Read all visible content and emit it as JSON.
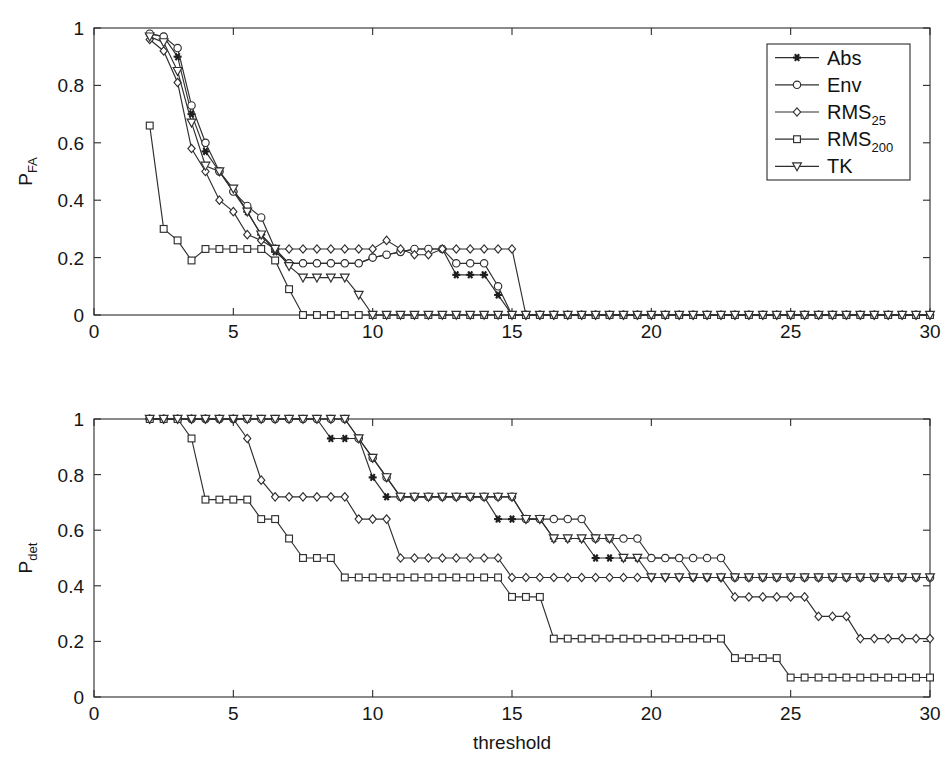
{
  "figure": {
    "background": "#ffffff",
    "ink": "#2b2b2b",
    "xlabel": "threshold"
  },
  "legend": {
    "position": "top-right of upper axes",
    "entries": [
      {
        "label": "Abs",
        "label_sub": "",
        "marker": "star-filled"
      },
      {
        "label": "Env",
        "label_sub": "",
        "marker": "circle-open"
      },
      {
        "label": "RMS",
        "label_sub": "25",
        "marker": "diamond-open"
      },
      {
        "label": "RMS",
        "label_sub": "200",
        "marker": "square-open"
      },
      {
        "label": "TK",
        "label_sub": "",
        "marker": "triangle-down-open"
      }
    ]
  },
  "chart_data": [
    {
      "type": "line",
      "title": "",
      "xlabel": "",
      "ylabel": "P",
      "ylabel_sub": "FA",
      "xlim": [
        0,
        30
      ],
      "ylim": [
        0,
        1
      ],
      "xticks": [
        0,
        5,
        10,
        15,
        20,
        25,
        30
      ],
      "yticks": [
        0,
        0.2,
        0.4,
        0.6,
        0.8,
        1
      ],
      "xticklabels": [
        "0",
        "5",
        "10",
        "15",
        "20",
        "25",
        "30"
      ],
      "yticklabels": [
        "0",
        "0.2",
        "0.4",
        "0.6",
        "0.8",
        "1"
      ],
      "grid": false,
      "legend_position": "upper right",
      "x": [
        2,
        2.5,
        3,
        3.5,
        4,
        4.5,
        5,
        5.5,
        6,
        6.5,
        7,
        7.5,
        8,
        8.5,
        9,
        9.5,
        10,
        10.5,
        11,
        11.5,
        12,
        12.5,
        13,
        13.5,
        14,
        14.5,
        15,
        15.5,
        16,
        16.5,
        17,
        17.5,
        18,
        18.5,
        19,
        19.5,
        20,
        20.5,
        21,
        21.5,
        22,
        22.5,
        23,
        23.5,
        24,
        24.5,
        25,
        25.5,
        26,
        26.5,
        27,
        27.5,
        28,
        28.5,
        29,
        29.5,
        30
      ],
      "series": [
        {
          "name": "Abs",
          "marker": "star-filled",
          "values": [
            0.98,
            0.97,
            0.9,
            0.7,
            0.57,
            0.5,
            0.43,
            0.36,
            0.28,
            0.22,
            0.18,
            0.18,
            0.18,
            0.18,
            0.18,
            0.18,
            0.2,
            0.21,
            0.22,
            0.23,
            0.23,
            0.23,
            0.14,
            0.14,
            0.14,
            0.07,
            0.0,
            0.0,
            0,
            0,
            0,
            0,
            0,
            0,
            0,
            0,
            0,
            0,
            0,
            0,
            0,
            0,
            0,
            0,
            0,
            0,
            0,
            0,
            0,
            0,
            0,
            0,
            0,
            0,
            0,
            0,
            0
          ]
        },
        {
          "name": "Env",
          "marker": "circle-open",
          "values": [
            0.98,
            0.97,
            0.93,
            0.73,
            0.6,
            0.5,
            0.43,
            0.38,
            0.34,
            0.23,
            0.18,
            0.18,
            0.18,
            0.18,
            0.18,
            0.18,
            0.2,
            0.21,
            0.22,
            0.23,
            0.23,
            0.23,
            0.18,
            0.18,
            0.18,
            0.1,
            0.0,
            0.0,
            0,
            0,
            0,
            0,
            0,
            0,
            0,
            0,
            0,
            0,
            0,
            0,
            0,
            0,
            0,
            0,
            0,
            0,
            0,
            0,
            0,
            0,
            0,
            0,
            0,
            0,
            0,
            0,
            0
          ]
        },
        {
          "name": "RMS25",
          "marker": "diamond-open",
          "values": [
            0.96,
            0.92,
            0.81,
            0.58,
            0.5,
            0.4,
            0.36,
            0.28,
            0.26,
            0.23,
            0.23,
            0.23,
            0.23,
            0.23,
            0.23,
            0.23,
            0.23,
            0.26,
            0.23,
            0.21,
            0.21,
            0.23,
            0.23,
            0.23,
            0.23,
            0.23,
            0.23,
            0.0,
            0,
            0,
            0,
            0,
            0,
            0,
            0,
            0,
            0,
            0,
            0,
            0,
            0,
            0,
            0,
            0,
            0,
            0,
            0,
            0,
            0,
            0,
            0,
            0,
            0,
            0,
            0,
            0,
            0
          ]
        },
        {
          "name": "RMS200",
          "marker": "square-open",
          "values": [
            0.66,
            0.3,
            0.26,
            0.19,
            0.23,
            0.23,
            0.23,
            0.23,
            0.23,
            0.19,
            0.09,
            0.0,
            0.0,
            0,
            0,
            0,
            0,
            0,
            0,
            0,
            0,
            0,
            0,
            0,
            0,
            0,
            0,
            0,
            0,
            0,
            0,
            0,
            0,
            0,
            0,
            0,
            0,
            0,
            0,
            0,
            0,
            0,
            0,
            0,
            0,
            0,
            0,
            0,
            0,
            0,
            0,
            0,
            0,
            0,
            0,
            0,
            0
          ]
        },
        {
          "name": "TK",
          "marker": "triangle-down-open",
          "values": [
            0.97,
            0.95,
            0.85,
            0.67,
            0.52,
            0.5,
            0.44,
            0.36,
            0.28,
            0.23,
            0.17,
            0.13,
            0.13,
            0.13,
            0.13,
            0.07,
            0.0,
            0.0,
            0,
            0,
            0,
            0,
            0,
            0,
            0,
            0,
            0,
            0,
            0,
            0,
            0,
            0,
            0,
            0,
            0,
            0,
            0,
            0,
            0,
            0,
            0,
            0,
            0,
            0,
            0,
            0,
            0,
            0,
            0,
            0,
            0,
            0,
            0,
            0,
            0,
            0,
            0
          ]
        }
      ]
    },
    {
      "type": "line",
      "title": "",
      "xlabel": "threshold",
      "ylabel": "P",
      "ylabel_sub": "det",
      "xlim": [
        0,
        30
      ],
      "ylim": [
        0,
        1
      ],
      "xticks": [
        0,
        5,
        10,
        15,
        20,
        25,
        30
      ],
      "yticks": [
        0,
        0.2,
        0.4,
        0.6,
        0.8,
        1
      ],
      "xticklabels": [
        "0",
        "5",
        "10",
        "15",
        "20",
        "25",
        "30"
      ],
      "yticklabels": [
        "0",
        "0.2",
        "0.4",
        "0.6",
        "0.8",
        "1"
      ],
      "grid": false,
      "legend_position": "none",
      "x": [
        2,
        2.5,
        3,
        3.5,
        4,
        4.5,
        5,
        5.5,
        6,
        6.5,
        7,
        7.5,
        8,
        8.5,
        9,
        9.5,
        10,
        10.5,
        11,
        11.5,
        12,
        12.5,
        13,
        13.5,
        14,
        14.5,
        15,
        15.5,
        16,
        16.5,
        17,
        17.5,
        18,
        18.5,
        19,
        19.5,
        20,
        20.5,
        21,
        21.5,
        22,
        22.5,
        23,
        23.5,
        24,
        24.5,
        25,
        25.5,
        26,
        26.5,
        27,
        27.5,
        28,
        28.5,
        29,
        29.5,
        30
      ],
      "series": [
        {
          "name": "Abs",
          "marker": "star-filled",
          "values": [
            1,
            1,
            1,
            1,
            1,
            1,
            1,
            1,
            1,
            1,
            1,
            1,
            1,
            0.93,
            0.93,
            0.93,
            0.79,
            0.72,
            0.72,
            0.72,
            0.72,
            0.72,
            0.72,
            0.72,
            0.72,
            0.64,
            0.64,
            0.64,
            0.64,
            0.57,
            0.57,
            0.57,
            0.5,
            0.5,
            0.5,
            0.5,
            0.5,
            0.5,
            0.5,
            0.43,
            0.43,
            0.43,
            0.43,
            0.43,
            0.43,
            0.43,
            0.43,
            0.43,
            0.43,
            0.43,
            0.43,
            0.43,
            0.43,
            0.43,
            0.43,
            0.43,
            0.43
          ]
        },
        {
          "name": "Env",
          "marker": "circle-open",
          "values": [
            1,
            1,
            1,
            1,
            1,
            1,
            1,
            1,
            1,
            1,
            1,
            1,
            1,
            1,
            1,
            0.93,
            0.86,
            0.79,
            0.72,
            0.72,
            0.72,
            0.72,
            0.72,
            0.72,
            0.72,
            0.72,
            0.72,
            0.64,
            0.64,
            0.64,
            0.64,
            0.64,
            0.57,
            0.57,
            0.57,
            0.57,
            0.5,
            0.5,
            0.5,
            0.5,
            0.5,
            0.5,
            0.43,
            0.43,
            0.43,
            0.43,
            0.43,
            0.43,
            0.43,
            0.43,
            0.43,
            0.43,
            0.43,
            0.43,
            0.43,
            0.43,
            0.43
          ]
        },
        {
          "name": "RMS25",
          "marker": "diamond-open",
          "values": [
            1,
            1,
            1,
            1,
            1,
            1,
            1,
            0.93,
            0.78,
            0.72,
            0.72,
            0.72,
            0.72,
            0.72,
            0.72,
            0.64,
            0.64,
            0.64,
            0.5,
            0.5,
            0.5,
            0.5,
            0.5,
            0.5,
            0.5,
            0.5,
            0.43,
            0.43,
            0.43,
            0.43,
            0.43,
            0.43,
            0.43,
            0.43,
            0.43,
            0.43,
            0.43,
            0.43,
            0.43,
            0.43,
            0.43,
            0.43,
            0.36,
            0.36,
            0.36,
            0.36,
            0.36,
            0.36,
            0.29,
            0.29,
            0.29,
            0.21,
            0.21,
            0.21,
            0.21,
            0.21,
            0.21
          ]
        },
        {
          "name": "RMS200",
          "marker": "square-open",
          "values": [
            1,
            1,
            1,
            0.93,
            0.71,
            0.71,
            0.71,
            0.71,
            0.64,
            0.64,
            0.57,
            0.5,
            0.5,
            0.5,
            0.43,
            0.43,
            0.43,
            0.43,
            0.43,
            0.43,
            0.43,
            0.43,
            0.43,
            0.43,
            0.43,
            0.43,
            0.36,
            0.36,
            0.36,
            0.21,
            0.21,
            0.21,
            0.21,
            0.21,
            0.21,
            0.21,
            0.21,
            0.21,
            0.21,
            0.21,
            0.21,
            0.21,
            0.14,
            0.14,
            0.14,
            0.14,
            0.07,
            0.07,
            0.07,
            0.07,
            0.07,
            0.07,
            0.07,
            0.07,
            0.07,
            0.07,
            0.07
          ]
        },
        {
          "name": "TK",
          "marker": "triangle-down-open",
          "values": [
            1,
            1,
            1,
            1,
            1,
            1,
            1,
            1,
            1,
            1,
            1,
            1,
            1,
            1,
            1,
            0.93,
            0.86,
            0.79,
            0.72,
            0.72,
            0.72,
            0.72,
            0.72,
            0.72,
            0.72,
            0.72,
            0.72,
            0.64,
            0.64,
            0.57,
            0.57,
            0.57,
            0.57,
            0.57,
            0.5,
            0.5,
            0.43,
            0.43,
            0.43,
            0.43,
            0.43,
            0.43,
            0.43,
            0.43,
            0.43,
            0.43,
            0.43,
            0.43,
            0.43,
            0.43,
            0.43,
            0.43,
            0.43,
            0.43,
            0.43,
            0.43,
            0.43
          ]
        }
      ]
    }
  ]
}
